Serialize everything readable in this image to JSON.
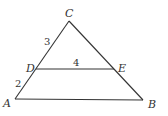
{
  "diagram": {
    "type": "triangle-with-parallel-segment",
    "points": {
      "C": {
        "label": "C",
        "x": 69,
        "y": 21
      },
      "A": {
        "label": "A",
        "x": 15,
        "y": 99
      },
      "B": {
        "label": "B",
        "x": 143,
        "y": 100
      },
      "D": {
        "label": "D",
        "x": 36,
        "y": 69
      },
      "E": {
        "label": "E",
        "x": 114,
        "y": 69
      }
    },
    "segment_labels": {
      "CD": "3",
      "DA": "2",
      "DE": "4"
    },
    "colors": {
      "stroke": "#333333",
      "background": "#ffffff"
    }
  }
}
